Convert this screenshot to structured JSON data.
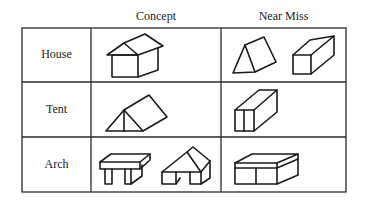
{
  "table": {
    "column_headers": [
      "Concept",
      "Near Miss"
    ],
    "rows": [
      {
        "label": "House",
        "concept": [
          "house-shape"
        ],
        "near_miss": [
          "triangular-prism-lying",
          "rectangular-block"
        ]
      },
      {
        "label": "Tent",
        "concept": [
          "triangular-prism-tent"
        ],
        "near_miss": [
          "upright-block-with-divider"
        ]
      },
      {
        "label": "Arch",
        "concept": [
          "flat-top-arch",
          "peaked-top-arch"
        ],
        "near_miss": [
          "closed-box-arch"
        ]
      }
    ]
  },
  "colors": {
    "line": "#1a1a1a",
    "background": "#ffffff"
  }
}
